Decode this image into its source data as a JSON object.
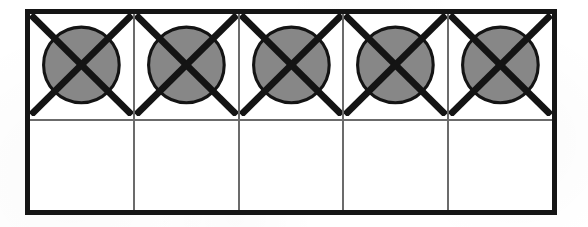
{
  "figure": {
    "title": "Ten frame with five crossed-out counters",
    "background_color": "#ffffff",
    "frame_color": "#151515",
    "divider_color": "#6b6b6b",
    "counter_fill_color": "#878787",
    "counter_outline_color": "#141414",
    "cross_color": "#141414"
  },
  "grid": {
    "rows": 2,
    "columns": 5,
    "total_cells": 10,
    "filled_cells": 5,
    "empty_cells": 5,
    "cells": [
      {
        "row": 1,
        "column": 1,
        "state": "crossed-counter",
        "counter": true,
        "crossed_out": true
      },
      {
        "row": 1,
        "column": 2,
        "state": "crossed-counter",
        "counter": true,
        "crossed_out": true
      },
      {
        "row": 1,
        "column": 3,
        "state": "crossed-counter",
        "counter": true,
        "crossed_out": true
      },
      {
        "row": 1,
        "column": 4,
        "state": "crossed-counter",
        "counter": true,
        "crossed_out": true
      },
      {
        "row": 1,
        "column": 5,
        "state": "crossed-counter",
        "counter": true,
        "crossed_out": true
      },
      {
        "row": 2,
        "column": 1,
        "state": "empty",
        "counter": false,
        "crossed_out": false
      },
      {
        "row": 2,
        "column": 2,
        "state": "empty",
        "counter": false,
        "crossed_out": false
      },
      {
        "row": 2,
        "column": 3,
        "state": "empty",
        "counter": false,
        "crossed_out": false
      },
      {
        "row": 2,
        "column": 4,
        "state": "empty",
        "counter": false,
        "crossed_out": false
      },
      {
        "row": 2,
        "column": 5,
        "state": "empty",
        "counter": false,
        "crossed_out": false
      }
    ]
  }
}
